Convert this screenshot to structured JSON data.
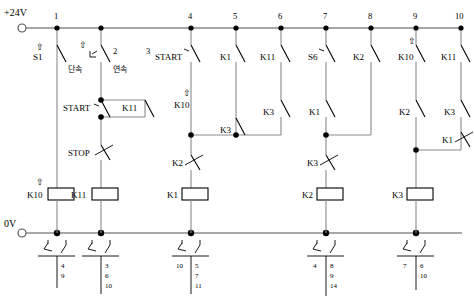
{
  "diagram": {
    "rails": {
      "top_label": "+24V",
      "bottom_label": "0V"
    },
    "rung_numbers": [
      "1",
      "2",
      "3",
      "4",
      "5",
      "6",
      "7",
      "8",
      "9",
      "10"
    ],
    "inline_numbers": {
      "selector_num": "2",
      "start2_num": "3"
    },
    "labels": {
      "s1": "S1",
      "selector_left": "단속",
      "selector_right": "연속",
      "start1": "START",
      "k11_seal": "K11",
      "stop1": "STOP",
      "k10_coil": "K10",
      "k11_coil": "K11",
      "start2": "START",
      "k10_contact": "K10",
      "k1_r5": "K1",
      "k3_r5": "K3",
      "k2_branch": "K2",
      "k1_coil": "K1",
      "k11_r6": "K11",
      "k3_r6": "K3",
      "s6": "S6",
      "k1_r7": "K1",
      "k2_r8": "K2",
      "k3_branch": "K3",
      "k2_coil": "K2",
      "k10_r9": "K10",
      "k2_r9": "K2",
      "k11_r10": "K11",
      "k3_r10": "K3",
      "k1_branch": "K1",
      "k3_coil": "K3"
    },
    "terminals": [
      {
        "name": "terminal-k10",
        "nc": [
          "4",
          "9"
        ],
        "no": []
      },
      {
        "name": "terminal-k11",
        "nc": [],
        "no": [
          "3",
          "6",
          "10"
        ]
      },
      {
        "name": "terminal-k1",
        "nc": [
          "10"
        ],
        "no": [
          "5",
          "7",
          "11"
        ]
      },
      {
        "name": "terminal-k2",
        "nc": [
          "4"
        ],
        "no": [
          "8",
          "9",
          "14"
        ]
      },
      {
        "name": "terminal-k3",
        "nc": [
          "7"
        ],
        "no": [
          "6",
          "10"
        ]
      }
    ],
    "colors": {
      "rail": "#8a8a8a",
      "symbol": "#000000",
      "background": "#ffffff"
    }
  }
}
